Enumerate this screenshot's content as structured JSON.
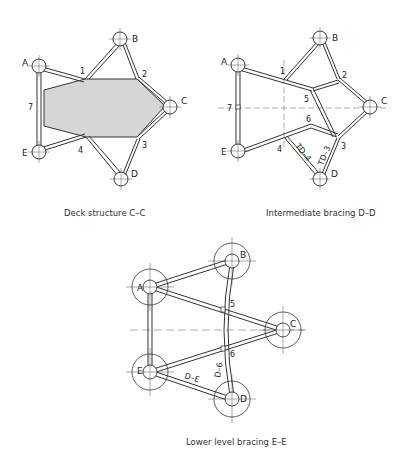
{
  "diagrams": [
    {
      "caption": "Deck structure C–C",
      "nodes": {
        "A": "A",
        "B": "B",
        "C": "C",
        "D": "D",
        "E": "E"
      },
      "points": {
        "1": "1",
        "2": "2",
        "3": "3",
        "4": "4",
        "7": "7"
      }
    },
    {
      "caption": "Intermediate bracing D–D",
      "nodes": {
        "A": "A",
        "B": "B",
        "C": "C",
        "D": "D",
        "E": "E"
      },
      "points": {
        "1": "1",
        "2": "2",
        "3": "3",
        "4": "4",
        "5": "5",
        "6": "6",
        "7": "7"
      },
      "member_labels": {
        "td4": "TD–4",
        "td3": "TD–3"
      }
    },
    {
      "caption": "Lower level bracing E–E",
      "nodes": {
        "A": "A",
        "B": "B",
        "C": "C",
        "D": "D",
        "E": "E"
      },
      "points": {
        "5": "5",
        "6": "6"
      },
      "member_labels": {
        "de": "D–E",
        "d6": "D–6"
      }
    }
  ],
  "colors": {
    "line": "#333333",
    "deck_fill": "#d6d6d6",
    "background": "#ffffff"
  }
}
